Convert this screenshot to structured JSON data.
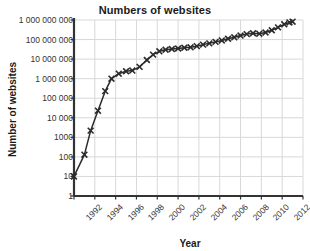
{
  "chart_data": {
    "type": "line",
    "title": "Numbers of websites",
    "xlabel": "Year",
    "ylabel": "Number of websites",
    "yscale": "log",
    "ylim": [
      1,
      1000000000
    ],
    "xlim": [
      1992,
      2014
    ],
    "grid": true,
    "legend": false,
    "marker": "x",
    "line_color": "#2b2b2b",
    "grid_color": "#d8d8d8",
    "axis_color": "#333333",
    "ytick_labels": [
      "1 000 000 000",
      "100 000 000",
      "10 000 000",
      "1 000 000",
      "100 000",
      "10 000",
      "1000",
      "100",
      "10",
      "1"
    ],
    "ytick_values": [
      1000000000,
      100000000,
      10000000,
      1000000,
      100000,
      10000,
      1000,
      100,
      10,
      1
    ],
    "xtick_labels": [
      "1992",
      "1994",
      "1996",
      "1998",
      "2000",
      "2002",
      "2004",
      "2006",
      "2008",
      "2010",
      "2012",
      "2014"
    ],
    "xtick_values": [
      1992,
      1994,
      1996,
      1998,
      2000,
      2002,
      2004,
      2006,
      2008,
      2010,
      2012,
      2014
    ],
    "x": [
      1992.0,
      1993.0,
      1993.6,
      1994.3,
      1995.0,
      1995.6,
      1996.3,
      1997.0,
      1997.6,
      1998.3,
      1999.0,
      1999.6,
      2000.2,
      2000.8,
      2001.4,
      2002.0,
      2002.6,
      2003.2,
      2003.8,
      2004.4,
      2005.0,
      2005.6,
      2006.2,
      2006.8,
      2007.4,
      2008.0,
      2008.6,
      2009.2,
      2009.8,
      2010.4,
      2011.0,
      2011.6,
      2012.2,
      2012.7,
      2013.0
    ],
    "values": [
      10,
      130,
      2200,
      23000,
      230000,
      1000000,
      1800000,
      2400000,
      2600000,
      4000000,
      9000000,
      17000000,
      25000000,
      30000000,
      33000000,
      35000000,
      38000000,
      40000000,
      46000000,
      55000000,
      64000000,
      76000000,
      90000000,
      110000000,
      130000000,
      160000000,
      190000000,
      210000000,
      200000000,
      230000000,
      300000000,
      420000000,
      600000000,
      750000000,
      820000000
    ]
  }
}
